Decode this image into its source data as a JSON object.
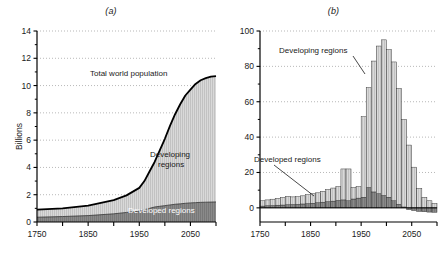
{
  "figure": {
    "background": "#ffffff",
    "panels": [
      {
        "id": "a",
        "label": "(a)",
        "ylabel": "Billions",
        "annotations": {
          "total": "Total world population",
          "developing": "Developing",
          "developing2": "regions",
          "developed": "Developed regions"
        }
      },
      {
        "id": "b",
        "label": "(b)",
        "ylabel": "Average annual increase per decade (millions)",
        "annotations": {
          "developing": "Developing regions",
          "developed": "Developed regions"
        }
      }
    ]
  },
  "colors": {
    "developed_fill": "#8a8a8a",
    "developing_fill": "#d9d9d9",
    "line": "#000000",
    "grid": "#9a9a9a",
    "axis": "#000000",
    "text": "#1a1a1a"
  },
  "chart_data": [
    {
      "type": "area",
      "title": "(a)",
      "xlabel": "",
      "ylabel": "Billions",
      "xlim": [
        1750,
        2100
      ],
      "ylim": [
        0,
        14
      ],
      "xticks": [
        1750,
        1850,
        1950,
        2050
      ],
      "xticks_minor": [
        1800,
        1900,
        2000,
        2100
      ],
      "yticks": [
        0,
        2,
        4,
        6,
        8,
        10,
        12,
        14
      ],
      "grid": true,
      "stacked": true,
      "x": [
        1750,
        1800,
        1850,
        1900,
        1925,
        1950,
        1960,
        1970,
        1980,
        1990,
        2000,
        2010,
        2020,
        2030,
        2040,
        2050,
        2060,
        2070,
        2080,
        2090,
        2100
      ],
      "series": [
        {
          "name": "Developed regions",
          "values": [
            0.35,
            0.4,
            0.47,
            0.6,
            0.7,
            0.8,
            0.9,
            1.0,
            1.1,
            1.15,
            1.2,
            1.25,
            1.3,
            1.33,
            1.37,
            1.4,
            1.42,
            1.44,
            1.45,
            1.46,
            1.47
          ]
        },
        {
          "name": "Developing regions",
          "values": [
            0.55,
            0.6,
            0.73,
            1.0,
            1.25,
            1.7,
            2.1,
            2.7,
            3.3,
            4.1,
            4.9,
            5.8,
            6.6,
            7.3,
            7.9,
            8.3,
            8.7,
            8.95,
            9.1,
            9.2,
            9.23
          ]
        }
      ],
      "total_label": "Total world population",
      "total_values": [
        0.9,
        1.0,
        1.2,
        1.6,
        1.95,
        2.5,
        3.0,
        3.7,
        4.4,
        5.25,
        6.1,
        7.05,
        7.9,
        8.63,
        9.27,
        9.7,
        10.12,
        10.39,
        10.55,
        10.66,
        10.7
      ]
    },
    {
      "type": "bar",
      "title": "(b)",
      "xlabel": "",
      "ylabel": "Average annual increase per decade (millions)",
      "xlim": [
        1750,
        2100
      ],
      "ylim": [
        -8,
        100
      ],
      "xticks": [
        1750,
        1850,
        1950,
        2050
      ],
      "xticks_minor": [
        1800,
        1900,
        2000,
        2100
      ],
      "yticks": [
        0,
        20,
        40,
        60,
        80,
        100
      ],
      "grid": true,
      "stacked": true,
      "categories": [
        1750,
        1760,
        1770,
        1780,
        1790,
        1800,
        1810,
        1820,
        1830,
        1840,
        1850,
        1860,
        1870,
        1880,
        1890,
        1900,
        1910,
        1920,
        1930,
        1940,
        1950,
        1960,
        1970,
        1980,
        1990,
        2000,
        2010,
        2020,
        2030,
        2040,
        2050,
        2060,
        2070,
        2080,
        2090
      ],
      "series": [
        {
          "name": "Developed regions",
          "values": [
            1.0,
            1.2,
            1.3,
            1.5,
            1.6,
            1.8,
            1.9,
            2.0,
            2.2,
            2.4,
            2.6,
            2.9,
            3.2,
            3.5,
            3.8,
            4.2,
            4.5,
            4.0,
            5.0,
            5.5,
            6.0,
            11.5,
            9.0,
            8.0,
            7.0,
            6.0,
            4.0,
            2.0,
            0.5,
            -1.0,
            -1.5,
            -2.0,
            -2.2,
            -2.4,
            -2.5
          ]
        },
        {
          "name": "Developing regions",
          "values": [
            3.0,
            3.3,
            3.6,
            3.9,
            4.3,
            4.7,
            4.3,
            4.3,
            4.6,
            5.0,
            5.4,
            5.6,
            6.2,
            6.9,
            7.4,
            7.8,
            17.5,
            18.0,
            6.5,
            6.5,
            45.5,
            56.5,
            74.0,
            83.5,
            88.0,
            83.5,
            78.5,
            65.5,
            49.5,
            35.5,
            23.0,
            11.0,
            6.0,
            4.0,
            2.5
          ]
        }
      ]
    }
  ]
}
